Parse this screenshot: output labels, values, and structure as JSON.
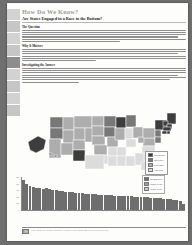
{
  "page": {
    "title": "How Do We Know?",
    "subtitle": "Are States Engaged in a Race to the Bottom?"
  },
  "sections": [
    {
      "heading": "The Question",
      "body": "Critics of welfare reform argue that states competing for business may reduce their own benefit levels in order to avoid becoming a magnet for low-income families, a process sometimes called a race to the bottom. States watch what their neighbors do, and when one state cuts benefits, surrounding states feel pressure to follow. Is there evidence that states actually behave this way, or do benefit differences simply reflect differences in cost of living and state wealth?"
    },
    {
      "heading": "Why It Matters",
      "body": "If states truly respond to one another's benefit decisions, then welfare policy is not set independently by each legislature; it is shaped by regional competition. That would mean national standards, rather than state discretion, may be necessary to keep a safety net intact. The size and direction of these spillovers tells us a great deal about how federalism works in practice and about whether decentralization improves or erodes support for the poor."
    },
    {
      "heading": "Investigating the Answer",
      "body": "Researchers compare maximum monthly benefit levels across the fifty states and the District of Columbia, then test whether changes in one state's benefits predict changes in neighboring states. The map shades states by benefit generosity and the bar chart ranks every state from highest to lowest maximum benefit for a family of three. Benefits vary by more than a factor of three across states, and the geographic clustering visible in the map is consistent with regional competition, though differences in cost of living explain part of the pattern as well."
    }
  ],
  "map": {
    "legend_title": "Maximum monthly benefit",
    "legend_items": [
      {
        "label": "$600 and above",
        "color": "#3d3d3d"
      },
      {
        "label": "$450 to $599",
        "color": "#787878"
      },
      {
        "label": "$300 to $449",
        "color": "#adadad"
      },
      {
        "label": "Under $300",
        "color": "#dcdcdc"
      }
    ]
  },
  "chart_data": {
    "type": "bar",
    "xlabel": "State",
    "ylabel": "Dollars per month",
    "ylim": [
      0,
      1000
    ],
    "yticks": [
      0,
      200,
      400,
      600,
      800,
      1000
    ],
    "grid": false,
    "legend_position": "top-right",
    "legend": [
      {
        "label": "Maximum benefit",
        "color": "#6e6e6e"
      },
      {
        "label": "Regional average",
        "color": "#9e9e9e"
      },
      {
        "label": "National average",
        "color": "#c8c8c8"
      }
    ],
    "categories": [
      "AK",
      "NY",
      "CA",
      "VT",
      "NH",
      "MA",
      "CT",
      "WI",
      "RI",
      "HI",
      "MN",
      "WA",
      "OR",
      "NJ",
      "MD",
      "ME",
      "MI",
      "UT",
      "NM",
      "PA",
      "IA",
      "ND",
      "SD",
      "MT",
      "NE",
      "OH",
      "CO",
      "KS",
      "IL",
      "VA",
      "NV",
      "DE",
      "WY",
      "OK",
      "FL",
      "AZ",
      "GA",
      "NC",
      "SC",
      "WV",
      "ID",
      "IN",
      "MO",
      "LA",
      "KY",
      "AR",
      "TN",
      "TX",
      "AL",
      "MS"
    ],
    "values": [
      923,
      789,
      714,
      699,
      675,
      663,
      651,
      653,
      638,
      610,
      592,
      578,
      570,
      559,
      547,
      534,
      522,
      514,
      506,
      497,
      489,
      481,
      474,
      468,
      461,
      455,
      450,
      444,
      438,
      432,
      427,
      421,
      416,
      410,
      404,
      398,
      392,
      386,
      380,
      374,
      367,
      360,
      352,
      344,
      336,
      327,
      318,
      303,
      269,
      196
    ]
  },
  "footer": {
    "page_number": "190",
    "text": "PART FOUR  •  CHAPTER 6  •  POVERTY AND WELFARE PROGRAMS IN THE UNITED STATES"
  }
}
